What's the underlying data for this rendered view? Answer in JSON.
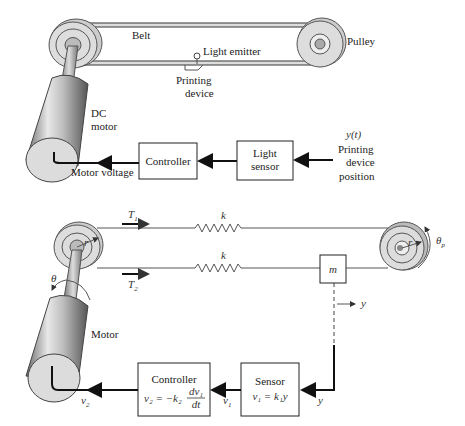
{
  "top_figure": {
    "labels": {
      "belt": "Belt",
      "pulley": "Pulley",
      "light_emitter": "Light emitter",
      "printing_device_line1": "Printing",
      "printing_device_line2": "device",
      "dc_motor_line1": "DC",
      "dc_motor_line2": "motor",
      "motor_voltage": "Motor voltage",
      "position_signal": "y(t)",
      "position_line1": "Printing",
      "position_line2": "device",
      "position_line3": "position"
    },
    "blocks": {
      "controller": "Controller",
      "light_sensor_line1": "Light",
      "light_sensor_line2": "sensor"
    }
  },
  "bottom_figure": {
    "labels": {
      "tension1": "T",
      "tension1_sub": "1",
      "tension2": "T",
      "tension2_sub": "2",
      "spring_upper": "k",
      "spring_lower": "k",
      "mass": "m",
      "radius_left": "r",
      "radius_right": "r",
      "theta": "θ",
      "theta_p": "θ",
      "theta_p_sub": "p",
      "displacement": "y",
      "motor": "Motor",
      "sensor_input": "y",
      "v1": "v",
      "v1_sub": "1",
      "v2": "v",
      "v2_sub": "2"
    },
    "blocks": {
      "controller_title": "Controller",
      "controller_eq_lhs": "v₂ = −k₂",
      "controller_eq_num": "dv₁",
      "controller_eq_den": "dt",
      "sensor_title": "Sensor",
      "sensor_eq": "v₁ = k₁y"
    }
  }
}
